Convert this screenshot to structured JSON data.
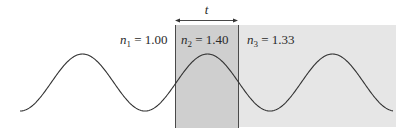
{
  "diagram": {
    "thickness_label": "t",
    "media": [
      {
        "symbol": "n",
        "subscript": "1",
        "value": "1.00",
        "label_text": " = 1.00"
      },
      {
        "symbol": "n",
        "subscript": "2",
        "value": "1.40",
        "label_text": " = 1.40"
      },
      {
        "symbol": "n",
        "subscript": "3",
        "value": "1.33",
        "label_text": " = 1.33"
      }
    ],
    "colors": {
      "background": "#ffffff",
      "film_fill": "#cfcfcf",
      "substrate_fill": "#e6e6e6",
      "wave_stroke": "#333333",
      "boundary_stroke": "#4a4a4a"
    },
    "wave": {
      "type": "sinusoid",
      "x_start": 20,
      "x_end": 393,
      "crest_y": 54,
      "trough_y": 111,
      "half_period_px": 62.5
    }
  }
}
